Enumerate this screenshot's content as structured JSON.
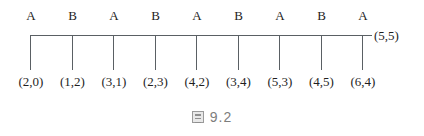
{
  "figure": {
    "caption_symbol": "图",
    "caption_number": "9.2",
    "end_annotation": "(5,5)",
    "geometry": {
      "spine_y": 35,
      "spine_x_start": 31,
      "spine_x_end": 372,
      "tick_spacing": 41.5,
      "tick_bottom_y": 70
    },
    "nodes": [
      {
        "top_label": "A",
        "coord": "(2,0)",
        "x": 31
      },
      {
        "top_label": "B",
        "coord": "(1,2)",
        "x": 72.5
      },
      {
        "top_label": "A",
        "coord": "(3,1)",
        "x": 114
      },
      {
        "top_label": "B",
        "coord": "(2,3)",
        "x": 155.5
      },
      {
        "top_label": "A",
        "coord": "(4,2)",
        "x": 197
      },
      {
        "top_label": "B",
        "coord": "(3,4)",
        "x": 238.5
      },
      {
        "top_label": "A",
        "coord": "(5,3)",
        "x": 280
      },
      {
        "top_label": "B",
        "coord": "(4,5)",
        "x": 321.5
      },
      {
        "top_label": "A",
        "coord": "(6,4)",
        "x": 363
      }
    ],
    "colors": {
      "line": "#5a6064",
      "text": "#1f1f1f",
      "caption": "#7d7d7d",
      "background": "#ffffff"
    }
  }
}
